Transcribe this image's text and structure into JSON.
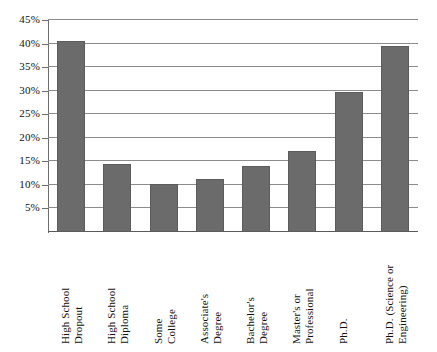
{
  "chart_data": {
    "type": "bar",
    "title": "",
    "subtitle": "",
    "xlabel": "",
    "ylabel": "",
    "categories": [
      "High School Dropout",
      "High School Diploma",
      "Some College",
      "Associate's Degree",
      "Bachelor's Degree",
      "Master's or Professional",
      "Ph.D.",
      "Ph.D. (Science or Engineering)"
    ],
    "category_lines": [
      [
        "High School",
        "Dropout"
      ],
      [
        "High School",
        "Diploma"
      ],
      [
        "Some",
        "College"
      ],
      [
        "Associate's",
        "Degree"
      ],
      [
        "Bachelor's",
        "Degree"
      ],
      [
        "Master's or",
        "Professional"
      ],
      [
        "Ph.D."
      ],
      [
        "Ph.D. (Science or",
        "Engineering)"
      ]
    ],
    "values": [
      40.6,
      14.4,
      10.2,
      11.3,
      14.1,
      17.1,
      29.8,
      39.4
    ],
    "ylim": [
      0,
      45
    ],
    "ytick_values": [
      5,
      10,
      15,
      20,
      25,
      30,
      35,
      40,
      45
    ],
    "ytick_labels": [
      "5%",
      "10%",
      "15%",
      "20%",
      "25%",
      "30%",
      "35%",
      "40%",
      "45%"
    ],
    "grid": true,
    "grid_axis": "y",
    "legend": false,
    "legend_position": "none",
    "bar_color": "#6b6b6b",
    "gridline_color": "#8c8c8c",
    "axis_color": "#6e6e6e",
    "background_color": "#ffffff"
  }
}
